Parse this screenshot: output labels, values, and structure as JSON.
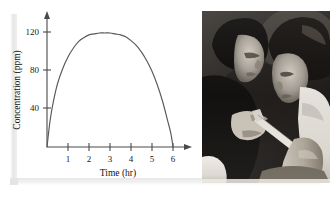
{
  "figure": {
    "kind": "textbook-figure",
    "photo": {
      "alt_name": "injection-photograph",
      "description": "Black and white photograph of a physician administering an injection into a patient's upper arm",
      "subjects": [
        "physician",
        "patient",
        "syringe"
      ]
    }
  },
  "chart_data": {
    "type": "line",
    "title": "",
    "xlabel": "Time (hr)",
    "ylabel": "Concentration (ppm)",
    "xlim": [
      0,
      6.5
    ],
    "ylim": [
      0,
      135
    ],
    "xticks": [
      1,
      2,
      3,
      4,
      5,
      6
    ],
    "xticklabels": [
      "1",
      "2",
      "3",
      "4",
      "5",
      "6"
    ],
    "yticks": [
      40,
      80,
      120
    ],
    "yticklabels": [
      "40",
      "80",
      "120"
    ],
    "grid": false,
    "legend": false,
    "axis_arrows": true,
    "series": [
      {
        "name": "Concentration",
        "color": "#595959",
        "x": [
          0.0,
          0.15,
          0.3,
          0.5,
          0.75,
          1.0,
          1.25,
          1.5,
          1.75,
          2.0,
          2.25,
          2.5,
          2.75,
          3.0,
          3.25,
          3.5,
          3.75,
          4.0,
          4.25,
          4.5,
          4.75,
          5.0,
          5.25,
          5.5,
          5.75,
          5.9,
          6.0
        ],
        "y": [
          0,
          28,
          47,
          66,
          82,
          94,
          103,
          110,
          114,
          117,
          118,
          119,
          119,
          119,
          118,
          117,
          115,
          111,
          106,
          99,
          90,
          79,
          65,
          48,
          27,
          14,
          0
        ]
      }
    ],
    "annotations": {
      "peak_value": 119,
      "peak_time": 3,
      "start_time": 0,
      "end_time": 6
    }
  },
  "axis_labels": {
    "y_axis_title": "Concentration (ppm)",
    "x_axis_title": "Time (hr)",
    "y_tick_120": "120",
    "y_tick_80": "80",
    "y_tick_40": "40",
    "x_tick_1": "1",
    "x_tick_2": "2",
    "x_tick_3": "3",
    "x_tick_4": "4",
    "x_tick_5": "5",
    "x_tick_6": "6"
  },
  "colors": {
    "curve": "#595959",
    "axis": "#4a4a4a",
    "text": "#1a1a1a",
    "photo_dark": "#101010",
    "photo_light": "#e9e6e0",
    "page_background": "#ffffff",
    "shadow": "#e6e6e6"
  }
}
